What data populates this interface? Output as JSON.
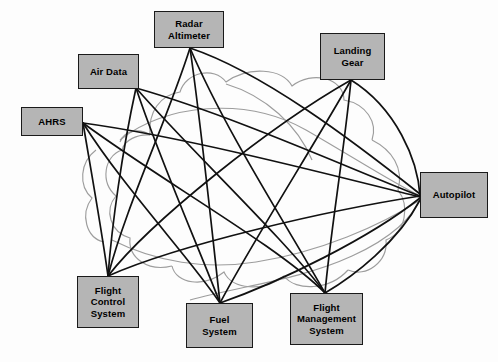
{
  "diagram": {
    "canvas": {
      "width": 498,
      "height": 362
    },
    "style": {
      "node_fill": "#b5b5b5",
      "node_border": "#1a1a1a",
      "link_color": "#111111",
      "cloud_color": "#9a9a9a",
      "background": "#fdfdfd"
    },
    "nodes": [
      {
        "id": "radar_altimeter",
        "label": "Radar\nAltimeter",
        "label_lines": [
          "Radar",
          "Altimeter"
        ],
        "x": 154,
        "y": 11,
        "w": 70,
        "h": 37,
        "anchor": {
          "x": 190,
          "y": 48
        }
      },
      {
        "id": "air_data",
        "label": "Air Data",
        "label_lines": [
          "Air Data"
        ],
        "x": 78,
        "y": 54,
        "w": 61,
        "h": 35,
        "anchor": {
          "x": 136,
          "y": 88
        }
      },
      {
        "id": "ahrs",
        "label": "AHRS",
        "label_lines": [
          "AHRS"
        ],
        "x": 21,
        "y": 107,
        "w": 62,
        "h": 29,
        "anchor": {
          "x": 83,
          "y": 123
        }
      },
      {
        "id": "landing_gear",
        "label": "Landing\nGear",
        "label_lines": [
          "Landing",
          "Gear"
        ],
        "x": 320,
        "y": 33,
        "w": 65,
        "h": 47,
        "anchor": {
          "x": 351,
          "y": 80
        }
      },
      {
        "id": "autopilot",
        "label": "Autopilot",
        "label_lines": [
          "Autopilot"
        ],
        "x": 420,
        "y": 172,
        "w": 68,
        "h": 46,
        "anchor": {
          "x": 420,
          "y": 196
        }
      },
      {
        "id": "flight_control_system",
        "label": "Flight\nControl\nSystem",
        "label_lines": [
          "Flight",
          "Control",
          "System"
        ],
        "x": 77,
        "y": 276,
        "w": 62,
        "h": 52,
        "anchor": {
          "x": 108,
          "y": 276
        }
      },
      {
        "id": "fuel_system",
        "label": "Fuel System",
        "label_lines": [
          "Fuel System"
        ],
        "x": 186,
        "y": 303,
        "w": 67,
        "h": 45,
        "anchor": {
          "x": 220,
          "y": 303
        }
      },
      {
        "id": "flight_management_system",
        "label": "Flight\nManagement\nSystem",
        "label_lines": [
          "Flight",
          "Management",
          "System"
        ],
        "x": 290,
        "y": 293,
        "w": 73,
        "h": 52,
        "anchor": {
          "x": 325,
          "y": 293
        }
      }
    ],
    "links": [
      {
        "from": "radar_altimeter",
        "to": "autopilot"
      },
      {
        "from": "radar_altimeter",
        "to": "flight_control_system"
      },
      {
        "from": "radar_altimeter",
        "to": "fuel_system"
      },
      {
        "from": "radar_altimeter",
        "to": "flight_management_system"
      },
      {
        "from": "air_data",
        "to": "autopilot"
      },
      {
        "from": "air_data",
        "to": "flight_control_system"
      },
      {
        "from": "air_data",
        "to": "fuel_system"
      },
      {
        "from": "air_data",
        "to": "flight_management_system"
      },
      {
        "from": "ahrs",
        "to": "autopilot"
      },
      {
        "from": "ahrs",
        "to": "flight_control_system"
      },
      {
        "from": "ahrs",
        "to": "fuel_system"
      },
      {
        "from": "ahrs",
        "to": "flight_management_system"
      },
      {
        "from": "landing_gear",
        "to": "autopilot"
      },
      {
        "from": "landing_gear",
        "to": "flight_control_system"
      },
      {
        "from": "landing_gear",
        "to": "fuel_system"
      },
      {
        "from": "landing_gear",
        "to": "flight_management_system"
      },
      {
        "from": "autopilot",
        "to": "flight_control_system"
      },
      {
        "from": "autopilot",
        "to": "fuel_system"
      },
      {
        "from": "autopilot",
        "to": "flight_management_system"
      }
    ],
    "link_count": 19,
    "node_count": 8
  }
}
